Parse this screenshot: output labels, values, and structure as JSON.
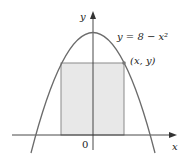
{
  "diagram": {
    "type": "graph",
    "curve_label": "y = 8 − x²",
    "point_label": "(x, y)",
    "axis_x_label": "x",
    "axis_y_label": "y",
    "origin_label": "0",
    "colors": {
      "curve": "#6b6b6b",
      "rectangle_fill": "#e8e8e8",
      "rectangle_stroke": "#8a8a8a",
      "axes": "#333333",
      "point": "#777777"
    }
  }
}
